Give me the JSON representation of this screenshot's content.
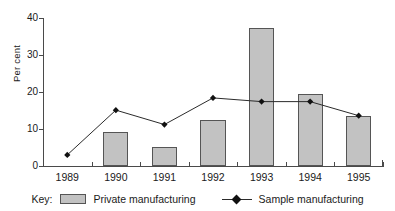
{
  "chart_data": {
    "type": "bar",
    "title": "",
    "xlabel": "",
    "ylabel": "Per cent",
    "categories": [
      "1989",
      "1990",
      "1991",
      "1992",
      "1993",
      "1994",
      "1995"
    ],
    "ylim": [
      0,
      40
    ],
    "yticks": [
      0,
      10,
      20,
      30,
      40
    ],
    "ytick_labels": [
      "0",
      "10",
      "20",
      "30",
      "40"
    ],
    "grid": false,
    "legend_position": "bottom",
    "series": [
      {
        "name": "Private manufacturing",
        "type": "bar",
        "color": "#c2c2c2",
        "values": [
          0,
          9.2,
          5.2,
          12.3,
          37.3,
          19.5,
          13.5
        ]
      },
      {
        "name": "Sample manufacturing",
        "type": "line",
        "color": "#2b2b2b",
        "marker": "diamond",
        "values": [
          3.0,
          15.1,
          11.2,
          18.4,
          17.4,
          17.4,
          13.6
        ]
      }
    ]
  },
  "legend": {
    "title": "Key:",
    "bar_label": "Private manufacturing",
    "line_label": "Sample manufacturing"
  }
}
